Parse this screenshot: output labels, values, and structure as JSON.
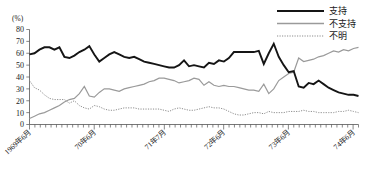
{
  "chart_data": {
    "type": "line",
    "title": "",
    "xlabel": "",
    "ylabel": "(%)",
    "ylim": [
      0,
      80
    ],
    "ytick_step": 10,
    "ytick_labels": [
      "80",
      "70",
      "60",
      "50",
      "40",
      "30",
      "20",
      "10",
      "0"
    ],
    "grid": false,
    "legend_position": "top-right",
    "x_tick_count": 62,
    "x_axis_labels": [
      {
        "index": 0,
        "label": "1969年6月"
      },
      {
        "index": 12,
        "label": "70年6月"
      },
      {
        "index": 25,
        "label": "71年7月"
      },
      {
        "index": 36,
        "label": "72年6月"
      },
      {
        "index": 48,
        "label": "73年6月"
      },
      {
        "index": 60,
        "label": "74年6月"
      }
    ],
    "series": [
      {
        "name": "支持",
        "style": "solid-thick",
        "color": "#151515",
        "values": [
          59,
          60,
          63,
          65,
          65,
          63,
          65,
          57,
          56,
          58,
          61,
          63,
          66,
          59,
          53,
          56,
          59,
          61,
          59,
          57,
          56,
          57,
          55,
          53,
          52,
          51,
          50,
          49,
          48,
          48,
          50,
          54,
          49,
          50,
          49,
          48,
          52,
          51,
          54,
          53,
          56,
          61,
          61,
          61,
          61,
          61,
          62,
          51,
          60,
          68,
          57,
          50,
          44,
          45,
          32,
          31,
          35,
          34,
          37,
          34,
          31,
          29,
          27,
          26,
          25,
          25,
          24
        ]
      },
      {
        "name": "不支持",
        "style": "solid-thin",
        "color": "#9a9a9a",
        "values": [
          5,
          7,
          9,
          10,
          12,
          14,
          16,
          19,
          21,
          22,
          26,
          32,
          24,
          23,
          27,
          30,
          30,
          29,
          28,
          30,
          31,
          32,
          33,
          34,
          36,
          37,
          39,
          39,
          38,
          37,
          35,
          36,
          37,
          39,
          38,
          33,
          36,
          33,
          32,
          33,
          32,
          32,
          31,
          30,
          29,
          29,
          28,
          34,
          26,
          30,
          37,
          40,
          43,
          44,
          56,
          53,
          54,
          55,
          57,
          58,
          60,
          62,
          61,
          63,
          62,
          64,
          65
        ]
      },
      {
        "name": "不明",
        "style": "dotted",
        "color": "#8d8d8d",
        "values": [
          37,
          31,
          29,
          25,
          22,
          21,
          21,
          21,
          18,
          20,
          16,
          14,
          13,
          16,
          15,
          13,
          12,
          12,
          13,
          14,
          14,
          14,
          13,
          13,
          13,
          13,
          13,
          12,
          11,
          13,
          14,
          13,
          12,
          12,
          13,
          14,
          15,
          14,
          14,
          13,
          11,
          9,
          8,
          8,
          9,
          10,
          10,
          9,
          11,
          10,
          10,
          10,
          11,
          11,
          11,
          12,
          11,
          11,
          10,
          10,
          10,
          10,
          11,
          11,
          12,
          11,
          10
        ]
      }
    ]
  },
  "legend": {
    "items": [
      {
        "label": "支持",
        "style": "solid-thick"
      },
      {
        "label": "不支持",
        "style": "solid-thin"
      },
      {
        "label": "不明",
        "style": "dotted"
      }
    ]
  }
}
